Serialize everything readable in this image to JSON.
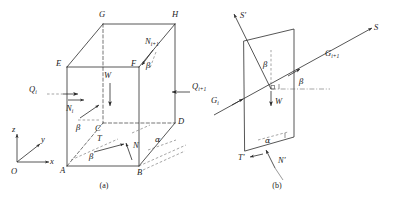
{
  "figure": {
    "type": "engineering-diagram",
    "background": "#ffffff",
    "ink": "#1a1a1a"
  },
  "panel_a": {
    "caption": "(a)",
    "vertices": [
      {
        "id": "A",
        "label": "A"
      },
      {
        "id": "B",
        "label": "B"
      },
      {
        "id": "C",
        "label": "C"
      },
      {
        "id": "D",
        "label": "D"
      },
      {
        "id": "E",
        "label": "E"
      },
      {
        "id": "F",
        "label": "F"
      },
      {
        "id": "G",
        "label": "G"
      },
      {
        "id": "H",
        "label": "H"
      }
    ],
    "forces": [
      {
        "id": "Qi",
        "base": "Q",
        "sub": "i",
        "label": "Q",
        "sublabel": "i"
      },
      {
        "id": "Qi1",
        "base": "Q",
        "sub": "i+1",
        "label": "Q",
        "sublabel": "i+1"
      },
      {
        "id": "Ni",
        "base": "N",
        "sub": "i",
        "label": "N",
        "sublabel": "i"
      },
      {
        "id": "Ni1",
        "base": "N",
        "sub": "i+1",
        "label": "N",
        "sublabel": "i+1"
      },
      {
        "id": "W",
        "base": "W",
        "sub": "",
        "label": "W",
        "sublabel": ""
      },
      {
        "id": "T",
        "base": "T",
        "sub": "",
        "label": "T",
        "sublabel": ""
      },
      {
        "id": "N",
        "base": "N",
        "sub": "",
        "label": "N",
        "sublabel": ""
      }
    ],
    "angles": [
      {
        "id": "beta-left",
        "label": "β"
      },
      {
        "id": "beta-right",
        "label": "β"
      },
      {
        "id": "beta-base",
        "label": "β"
      },
      {
        "id": "alpha-base",
        "label": "α"
      }
    ],
    "axes": {
      "origin": "O",
      "x": "x",
      "y": "y",
      "z": "z"
    }
  },
  "panel_b": {
    "caption": "(b)",
    "forces": [
      {
        "id": "S-prime",
        "base": "S",
        "sub": "",
        "label": "S′",
        "sublabel": ""
      },
      {
        "id": "S",
        "base": "S",
        "sub": "",
        "label": "S",
        "sublabel": ""
      },
      {
        "id": "Gi",
        "base": "G",
        "sub": "i",
        "label": "G",
        "sublabel": "i"
      },
      {
        "id": "Gi1",
        "base": "G",
        "sub": "i+1",
        "label": "G",
        "sublabel": "i+1"
      },
      {
        "id": "W",
        "base": "W",
        "sub": "",
        "label": "W",
        "sublabel": ""
      },
      {
        "id": "T-prime",
        "base": "T",
        "sub": "",
        "label": "T′",
        "sublabel": ""
      },
      {
        "id": "N-prime",
        "base": "N",
        "sub": "",
        "label": "N′",
        "sublabel": ""
      }
    ],
    "angles": [
      {
        "id": "beta-upper",
        "label": "β"
      },
      {
        "id": "beta-right",
        "label": "β"
      },
      {
        "id": "alpha-base",
        "label": "α"
      }
    ]
  }
}
